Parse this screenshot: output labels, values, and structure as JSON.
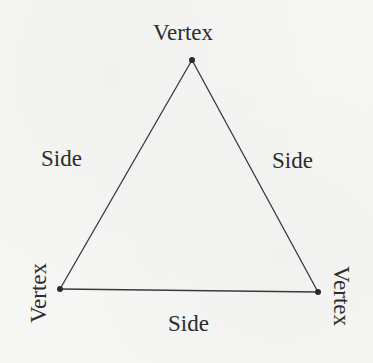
{
  "diagram": {
    "shape": "triangle",
    "colors": {
      "background": "#f6f6f4",
      "line": "#3a3a3a",
      "text": "#2c2c2c"
    },
    "vertices": [
      {
        "id": "top",
        "label": "Vertex",
        "x": 192,
        "y": 60
      },
      {
        "id": "bottom-left",
        "label": "Vertex",
        "x": 60,
        "y": 289
      },
      {
        "id": "bottom-right",
        "label": "Vertex",
        "x": 318,
        "y": 292
      }
    ],
    "sides": [
      {
        "id": "left",
        "label": "Side"
      },
      {
        "id": "right",
        "label": "Side"
      },
      {
        "id": "bottom",
        "label": "Side"
      }
    ]
  }
}
